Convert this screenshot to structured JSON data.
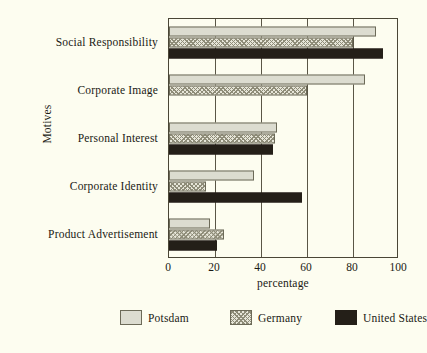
{
  "chart_data": {
    "type": "bar",
    "orientation": "horizontal",
    "title": "",
    "xlabel": "percentage",
    "ylabel": "Motives",
    "xlim": [
      0,
      100
    ],
    "xticks": [
      0,
      20,
      40,
      60,
      80,
      100
    ],
    "grid": true,
    "legend_position": "bottom",
    "categories": [
      "Social Responsibility",
      "Corporate Image",
      "Personal Interest",
      "Corporate Identity",
      "Product Advertisement"
    ],
    "series": [
      {
        "name": "Potsdam",
        "color": "#dcdcd0",
        "pattern": "solid",
        "values": [
          90,
          85,
          47,
          37,
          18
        ]
      },
      {
        "name": "Germany",
        "color": "#e6e5d8",
        "pattern": "hatched",
        "values": [
          80,
          60,
          46,
          16,
          24
        ]
      },
      {
        "name": "United States",
        "color": "#241f18",
        "pattern": "solid",
        "values": [
          93,
          0,
          45,
          58,
          21
        ]
      }
    ]
  },
  "caption": ""
}
